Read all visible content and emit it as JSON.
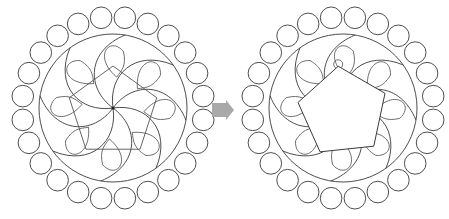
{
  "figure": {
    "colors": {
      "line": "#3a3a3a",
      "arrow": "#a9a9a9",
      "background": "#ffffff",
      "pentagon_fill_after": "#ffffff"
    },
    "left_panel": {
      "name": "before",
      "center": [
        113,
        108
      ],
      "bead_count": 24,
      "bead_ring_radius": 91,
      "bead_radius": 10.8,
      "inner_circle_radius": 74,
      "swirl_arms": 8,
      "pentagon": {
        "style": "outline",
        "radius": 46,
        "rotation_deg": 0
      }
    },
    "arrow": {
      "direction": "right",
      "x": 212,
      "y": 110
    },
    "right_panel": {
      "name": "after",
      "center": [
        343,
        108
      ],
      "bead_count": 24,
      "bead_ring_radius": 91,
      "bead_radius": 10.8,
      "inner_circle_radius": 74,
      "swirl_arms": 8,
      "pentagon": {
        "style": "filled",
        "radius": 46,
        "rotation_deg": -6
      }
    }
  }
}
